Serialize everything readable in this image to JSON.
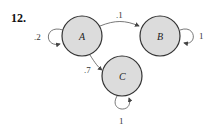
{
  "problem_number": "12.",
  "diagram": {
    "type": "markov-chain-state-diagram",
    "nodes": [
      {
        "id": "A",
        "label": "A"
      },
      {
        "id": "B",
        "label": "B"
      },
      {
        "id": "C",
        "label": "C"
      }
    ],
    "edges": [
      {
        "from": "A",
        "to": "A",
        "label": ".2"
      },
      {
        "from": "A",
        "to": "B",
        "label": ".1"
      },
      {
        "from": "A",
        "to": "C",
        "label": ".7"
      },
      {
        "from": "B",
        "to": "B",
        "label": "1"
      },
      {
        "from": "C",
        "to": "C",
        "label": "1"
      }
    ]
  }
}
